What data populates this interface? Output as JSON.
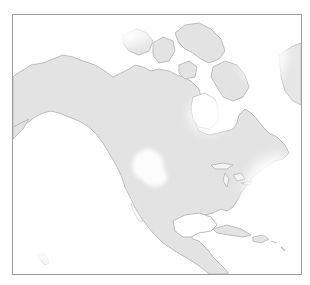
{
  "map": {
    "title": "North America",
    "description": "Grayscale shaded relief map of North America with a light white glow around Canada's interior, Hudson Bay and the Great Basin area",
    "colors": {
      "land": "#e2e2e2",
      "coast": "#b9b9b9",
      "water": "#ffffff",
      "frame": "#9e9e9e",
      "glow": "#ffffff"
    },
    "regions": [
      {
        "name": "Alaska"
      },
      {
        "name": "Canada"
      },
      {
        "name": "Canadian Arctic Archipelago"
      },
      {
        "name": "Greenland (edge)"
      },
      {
        "name": "Hudson Bay"
      },
      {
        "name": "United States"
      },
      {
        "name": "Great Lakes"
      },
      {
        "name": "Mexico"
      },
      {
        "name": "Gulf of Mexico"
      },
      {
        "name": "Central America"
      },
      {
        "name": "Caribbean Islands"
      },
      {
        "name": "Hawaii"
      }
    ]
  }
}
